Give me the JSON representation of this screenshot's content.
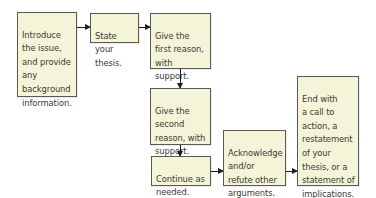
{
  "diagram": {
    "type": "flowchart",
    "colors": {
      "box_fill": "#f4f4d9",
      "box_border": "#5a5a50",
      "text": "#3a3a34",
      "arrow": "#1e1e1e"
    },
    "nodes": [
      {
        "id": "introduce",
        "text": "Introduce\nthe issue,\nand provide\nany\nbackground\ninformation."
      },
      {
        "id": "thesis",
        "text": "State your\nthesis."
      },
      {
        "id": "first-reason",
        "text": "Give the\nfirst reason,\nwith\nsupport."
      },
      {
        "id": "second-reason",
        "text": "Give the\nsecond\nreason, with\nsupport."
      },
      {
        "id": "continue",
        "text": "Continue as\nneeded."
      },
      {
        "id": "acknowledge",
        "text": "Acknowledge\nand/or\nrefute other\narguments."
      },
      {
        "id": "end",
        "text": "End with\na call to\naction, a\nrestatement\nof your\nthesis, or a\nstatement of\nimplications."
      }
    ],
    "edges": [
      {
        "from": "introduce",
        "to": "thesis"
      },
      {
        "from": "thesis",
        "to": "first-reason"
      },
      {
        "from": "first-reason",
        "to": "second-reason"
      },
      {
        "from": "second-reason",
        "to": "continue"
      },
      {
        "from": "continue",
        "to": "acknowledge"
      },
      {
        "from": "acknowledge",
        "to": "end"
      }
    ]
  }
}
